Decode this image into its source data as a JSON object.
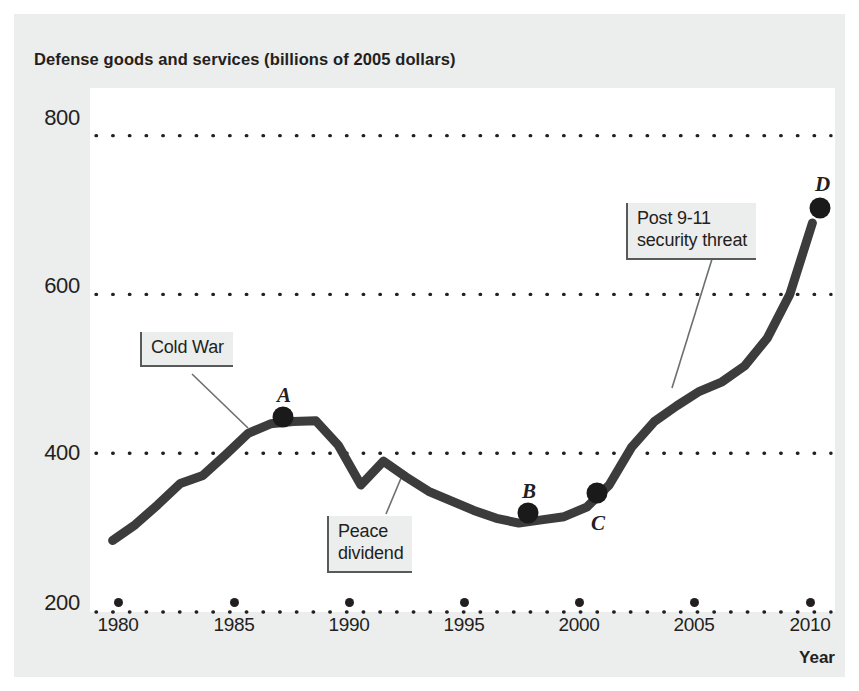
{
  "chart_data": {
    "type": "line",
    "title": "Defense goods and services (billions of 2005 dollars)",
    "xlabel": "Year",
    "ylabel": "",
    "xlim": [
      1979,
      2012
    ],
    "ylim": [
      200,
      860
    ],
    "grid": true,
    "grid_style": "dotted-horizontal",
    "legend": "none",
    "yticks": [
      200,
      400,
      600,
      800
    ],
    "xticks": [
      1980,
      1985,
      1990,
      1995,
      2000,
      2005,
      2010
    ],
    "series": [
      {
        "name": "Defense goods and services",
        "x": [
          1980,
          1981,
          1982,
          1983,
          1984,
          1985,
          1986,
          1987,
          1988,
          1989,
          1990,
          1991,
          1992,
          1993,
          1994,
          1995,
          1996,
          1997,
          1998,
          1999,
          2000,
          2001,
          2002,
          2003,
          2004,
          2005,
          2006,
          2007,
          2008,
          2009,
          2010,
          2011
        ],
        "values": [
          290,
          310,
          335,
          362,
          372,
          398,
          425,
          437,
          440,
          441,
          410,
          360,
          390,
          370,
          352,
          340,
          328,
          318,
          312,
          316,
          320,
          332,
          360,
          408,
          440,
          460,
          478,
          490,
          510,
          545,
          600,
          690
        ]
      }
    ],
    "annotations": [
      {
        "id": "cold-war",
        "text": "Cold War",
        "box_x": 140,
        "box_y": 332,
        "leader_from": [
          192,
          374
        ],
        "leader_to": [
          248,
          428
        ]
      },
      {
        "id": "peace-dividend",
        "text": "Peace\ndividend",
        "box_x": 327,
        "box_y": 516,
        "leader_from": [
          386,
          514
        ],
        "leader_to": [
          404,
          471
        ]
      },
      {
        "id": "post-911",
        "text": "Post 9-11\nsecurity threat",
        "box_x": 626,
        "box_y": 203,
        "leader_from": [
          712,
          259
        ],
        "leader_to": [
          672,
          388
        ]
      }
    ],
    "marked_points": [
      {
        "label": "A",
        "year": 1987,
        "value": 437,
        "px": 283,
        "py": 417,
        "label_dx": -6,
        "label_dy": -34
      },
      {
        "label": "B",
        "year": 1998,
        "value": 312,
        "px": 528,
        "py": 513,
        "label_dx": -6,
        "label_dy": -34
      },
      {
        "label": "C",
        "year": 2001,
        "value": 332,
        "px": 597,
        "py": 493,
        "label_dx": -6,
        "label_dy": 18
      },
      {
        "label": "D",
        "year": 2011,
        "value": 690,
        "px": 820,
        "py": 208,
        "label_dx": -5,
        "label_dy": -36
      }
    ],
    "colors": {
      "line": "#3c3c3c",
      "marker": "#1a1a1a",
      "grid": "#231f20",
      "text": "#231f20",
      "panel_background": "#ffffff",
      "figure_background": "#eceded",
      "callout_background": "#eceded",
      "callout_border": "#58595b"
    }
  }
}
